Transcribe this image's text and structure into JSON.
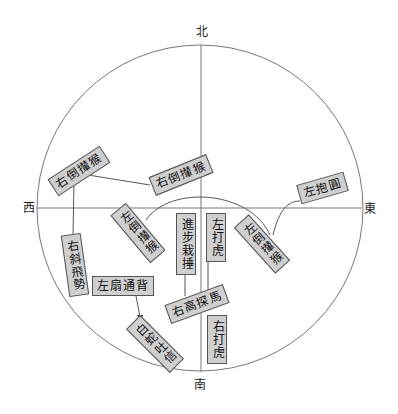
{
  "diagram": {
    "directions": {
      "north": "北",
      "south": "南",
      "west": "西",
      "east": "東"
    },
    "nodes": [
      {
        "id": "n1",
        "label": "右倒攆猴",
        "x": 73,
        "y": 170,
        "rotate": -33,
        "orientation": "horizontal"
      },
      {
        "id": "n2",
        "label": "右倒攆猴",
        "x": 178,
        "y": 173,
        "rotate": -22,
        "orientation": "horizontal"
      },
      {
        "id": "n3",
        "label": "左抱圓",
        "x": 321,
        "y": 186,
        "rotate": -16,
        "orientation": "horizontal"
      },
      {
        "id": "n4",
        "label": "右斜飛勢",
        "x": 75,
        "y": 258,
        "rotate": -8,
        "orientation": "vertical"
      },
      {
        "id": "n5",
        "label": "左倒攆猴",
        "x": 138,
        "y": 230,
        "rotate": -40,
        "orientation": "vertical"
      },
      {
        "id": "n6",
        "label": "進步栽捶",
        "x": 184,
        "y": 237,
        "rotate": 0,
        "orientation": "vertical"
      },
      {
        "id": "n7",
        "label": "左打虎",
        "x": 214,
        "y": 237,
        "rotate": 0,
        "orientation": "vertical"
      },
      {
        "id": "n8",
        "label": "左倒攆猴",
        "x": 262,
        "y": 241,
        "rotate": -42,
        "orientation": "vertical"
      },
      {
        "id": "n9",
        "label": "左扇通背",
        "x": 120,
        "y": 285,
        "rotate": 0,
        "orientation": "horizontal"
      },
      {
        "id": "n10",
        "label": "右高探馬",
        "x": 193,
        "y": 303,
        "rotate": -20,
        "orientation": "horizontal"
      },
      {
        "id": "n11",
        "label": "白蛇吐信",
        "x": 154,
        "y": 338,
        "rotate": -45,
        "orientation": "vertical"
      },
      {
        "id": "n12",
        "label": "右打虎",
        "x": 215,
        "y": 340,
        "rotate": 0,
        "orientation": "vertical"
      }
    ],
    "colors": {
      "box_fill": "#cfcfcf",
      "box_border": "#555555",
      "line": "#555555"
    }
  }
}
